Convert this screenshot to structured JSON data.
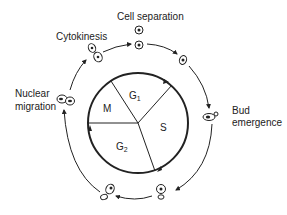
{
  "diagram": {
    "colors": {
      "stroke": "#222222",
      "background": "#ffffff"
    },
    "labels": {
      "cell_separation": "Cell separation",
      "cytokinesis": "Cytokinesis",
      "nuclear_migration_line1": "Nuclear",
      "nuclear_migration_line2": "migration",
      "bud_emergence_line1": "Bud",
      "bud_emergence_line2": "emergence"
    },
    "phases": {
      "g1": {
        "letter": "G",
        "sub": "1"
      },
      "s": {
        "letter": "S"
      },
      "g2": {
        "letter": "G",
        "sub": "2"
      },
      "m": {
        "letter": "M"
      }
    },
    "stages": [
      "Cell separation",
      "Unbudded cell (G1)",
      "Bud emergence",
      "Bud growth",
      "Large bud",
      "Nuclear migration",
      "Cytokinesis"
    ]
  }
}
